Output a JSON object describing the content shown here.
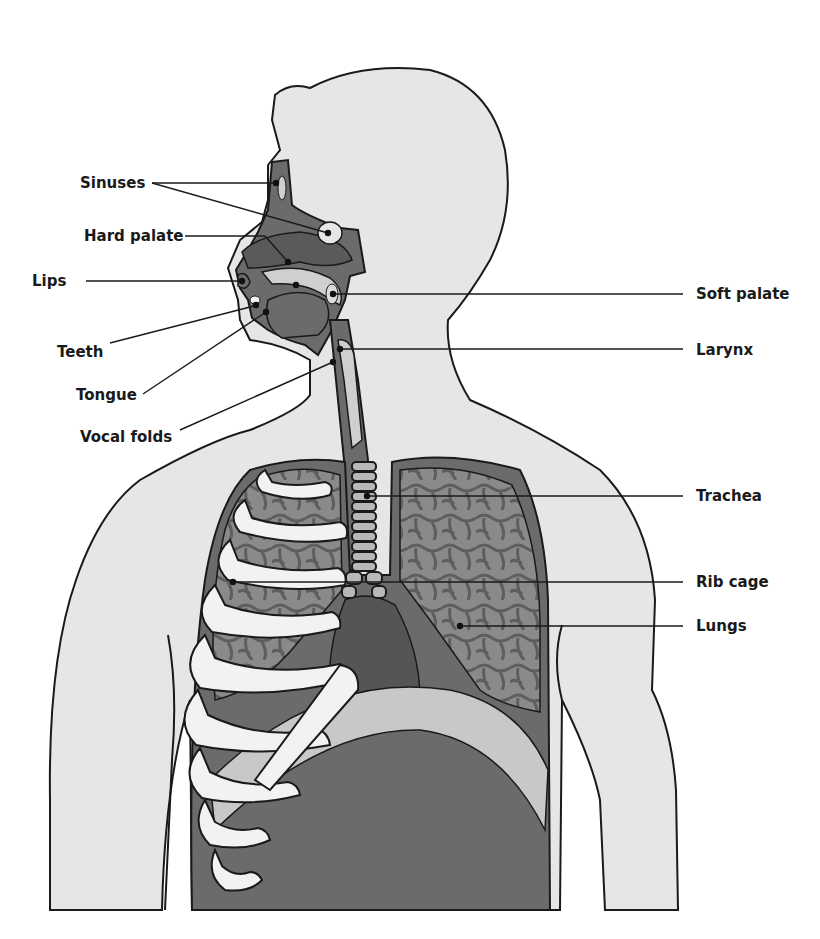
{
  "diagram": {
    "colors": {
      "body_fill": "#e6e6e6",
      "organ_dark": "#6b6b6b",
      "lung_fill": "#8a8a8a",
      "lung_cells": "#5e5e5e",
      "rib_fill": "#f2f2f2",
      "diaphragm_fill": "#c8c8c8",
      "outline": "#1a1a1a",
      "background": "#ffffff"
    },
    "labels_left": [
      {
        "id": "sinuses",
        "text": "Sinuses"
      },
      {
        "id": "hard-palate",
        "text": "Hard palate"
      },
      {
        "id": "lips",
        "text": "Lips"
      },
      {
        "id": "teeth",
        "text": "Teeth"
      },
      {
        "id": "tongue",
        "text": "Tongue"
      },
      {
        "id": "vocal-folds",
        "text": "Vocal folds"
      }
    ],
    "labels_right": [
      {
        "id": "soft-palate",
        "text": "Soft palate"
      },
      {
        "id": "larynx",
        "text": "Larynx"
      },
      {
        "id": "trachea",
        "text": "Trachea"
      },
      {
        "id": "rib-cage",
        "text": "Rib cage"
      },
      {
        "id": "lungs",
        "text": "Lungs"
      }
    ]
  }
}
